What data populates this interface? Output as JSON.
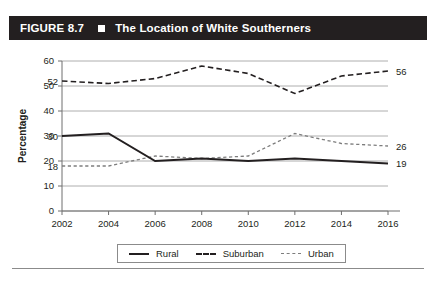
{
  "header": {
    "figure_number": "FIGURE 8.7",
    "square_icon": "filled-square-icon",
    "title": "The Location of White Southerners",
    "bar_color": "#231f20"
  },
  "chart_data": {
    "type": "line",
    "title": "The Location of White Southerners",
    "xlabel": "",
    "ylabel": "Percentage",
    "x": [
      2002,
      2004,
      2006,
      2008,
      2010,
      2012,
      2014,
      2016
    ],
    "categories": [
      "2002",
      "2004",
      "2006",
      "2008",
      "2010",
      "2012",
      "2014",
      "2016"
    ],
    "xlim": [
      2002,
      2016
    ],
    "ylim": [
      0,
      60
    ],
    "yticks": [
      0,
      10,
      20,
      30,
      40,
      50,
      60
    ],
    "ytick_labels": [
      "0",
      "10",
      "20",
      "30",
      "40",
      "50",
      "60"
    ],
    "grid": true,
    "legend_position": "bottom",
    "series": [
      {
        "name": "Rural",
        "style": "solid",
        "color": "#231f20",
        "values": [
          30,
          31,
          20,
          21,
          20,
          21,
          20,
          19
        ],
        "start_label": "30",
        "end_label": "19"
      },
      {
        "name": "Suburban",
        "style": "dashed",
        "color": "#231f20",
        "values": [
          52,
          51,
          53,
          58,
          55,
          47,
          54,
          56
        ],
        "start_label": "52",
        "end_label": "56"
      },
      {
        "name": "Urban",
        "style": "dotted-dashed",
        "color": "#7d7d7d",
        "values": [
          18,
          18,
          22,
          21,
          22,
          31,
          27,
          26
        ],
        "start_label": "18",
        "end_label": "26"
      }
    ]
  },
  "legend": {
    "items": [
      {
        "label": "Rural",
        "swatch": "solid-line-swatch"
      },
      {
        "label": "Suburban",
        "swatch": "dashed-line-swatch"
      },
      {
        "label": "Urban",
        "swatch": "dotted-line-swatch"
      }
    ]
  }
}
